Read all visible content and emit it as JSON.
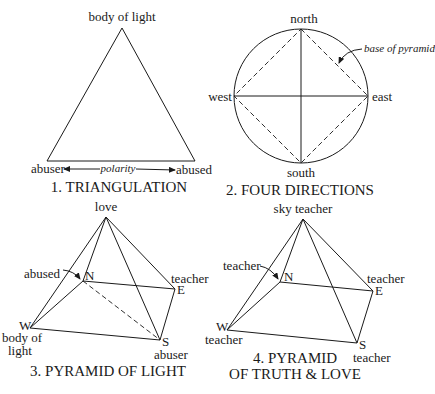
{
  "diagrams": [
    {
      "id": 1,
      "title": "1. TRIANGULATION",
      "labels": {
        "apex": "body of light",
        "left": "abuser",
        "right": "abused",
        "axis": "polarity"
      }
    },
    {
      "id": 2,
      "title": "2. FOUR DIRECTIONS",
      "labels": {
        "north": "north",
        "south": "south",
        "east": "east",
        "west": "west",
        "annotation": "base of pyramid"
      }
    },
    {
      "id": 3,
      "title": "3. PYRAMID OF LIGHT",
      "labels": {
        "apex": "love",
        "north_role": "abused",
        "north": "N",
        "east_role": "teacher",
        "east": "E",
        "west": "W",
        "west_role_line1": "body of",
        "west_role_line2": "light",
        "south": "S",
        "south_role": "abuser"
      }
    },
    {
      "id": 4,
      "title_line1": "4. PYRAMID",
      "title_line2": "OF TRUTH & LOVE",
      "labels": {
        "apex": "sky teacher",
        "north_role": "teacher",
        "north": "N",
        "east_role": "teacher",
        "east": "E",
        "west": "W",
        "west_role": "teacher",
        "south": "S",
        "south_role": "teacher"
      }
    }
  ]
}
